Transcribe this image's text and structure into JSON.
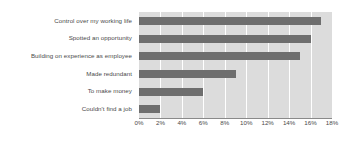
{
  "chart_data": {
    "type": "bar",
    "orientation": "horizontal",
    "title": "",
    "xlabel": "",
    "ylabel": "",
    "xlim": [
      0,
      18
    ],
    "xticks": [
      0,
      2,
      4,
      6,
      8,
      10,
      12,
      14,
      16,
      18
    ],
    "xtick_labels": [
      "0%",
      "2%",
      "4%",
      "6%",
      "8%",
      "10%",
      "12%",
      "14%",
      "16%",
      "18%"
    ],
    "grid": true,
    "grid_axis": "x",
    "legend": false,
    "categories": [
      "Control over my working life",
      "Spotted an opportunity",
      "Building on experience as employee",
      "Made redundant",
      "To make money",
      "Couldn't find a job"
    ],
    "values": [
      17,
      16,
      15,
      9,
      6,
      2
    ],
    "value_unit": "%",
    "colors": {
      "bar": "#6e6e6e",
      "plot_background": "#dcdcdc",
      "gridline": "#ffffff",
      "axis_line": "#8a8a8a",
      "text": "#4a4a4a",
      "figure_background": "#ffffff"
    }
  }
}
